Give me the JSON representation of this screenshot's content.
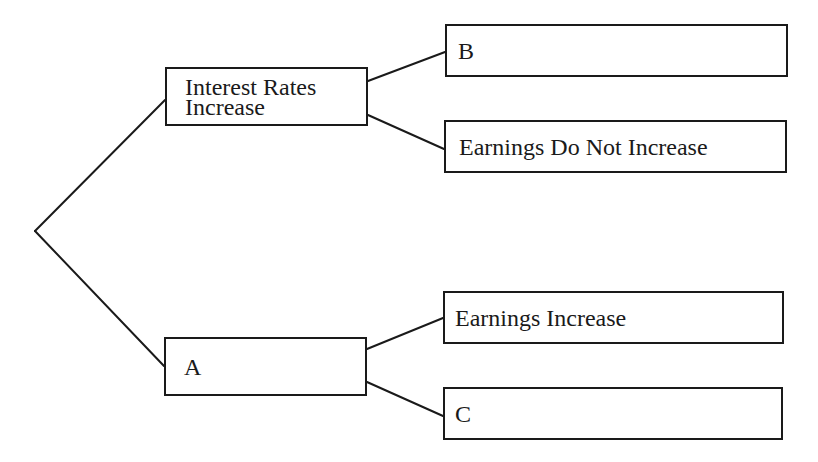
{
  "diagram": {
    "type": "decision-tree",
    "root": {
      "x": 35,
      "y": 231
    },
    "nodes": {
      "interest": {
        "lines": [
          "Interest Rates",
          "Increase"
        ],
        "box": [
          165,
          67,
          203,
          59
        ]
      },
      "a": {
        "label": "A",
        "box": [
          164,
          337,
          203,
          59
        ]
      },
      "b": {
        "label": "B",
        "box": [
          445,
          24,
          343,
          53
        ]
      },
      "earnings_no": {
        "label": "Earnings Do Not Increase",
        "box": [
          444,
          120,
          343,
          53
        ]
      },
      "earnings_yes": {
        "label": "Earnings Increase",
        "box": [
          443,
          291,
          341,
          53
        ]
      },
      "c": {
        "label": "C",
        "box": [
          443,
          387,
          340,
          53
        ]
      }
    },
    "edges": [
      {
        "from": "root",
        "to": "interest"
      },
      {
        "from": "root",
        "to": "a"
      },
      {
        "from": "interest",
        "to": "b"
      },
      {
        "from": "interest",
        "to": "earnings_no"
      },
      {
        "from": "a",
        "to": "earnings_yes"
      },
      {
        "from": "a",
        "to": "c"
      }
    ],
    "line_color": "#1a1a1a"
  }
}
